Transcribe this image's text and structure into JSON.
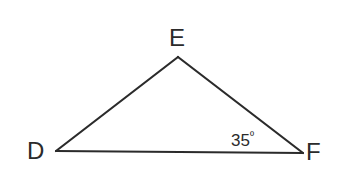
{
  "diagram": {
    "type": "triangle",
    "vertices": [
      {
        "id": "D",
        "label": "D",
        "x": 56,
        "y": 151
      },
      {
        "id": "E",
        "label": "E",
        "x": 178,
        "y": 57
      },
      {
        "id": "F",
        "label": "F",
        "x": 303,
        "y": 153
      }
    ],
    "sides": [
      "DE",
      "EF",
      "DF"
    ],
    "angles": [
      {
        "vertex": "F",
        "value": "35",
        "unit": "º"
      }
    ],
    "colors": {
      "stroke": "#2b2b2b",
      "text": "#2b2b2b",
      "background": "#ffffff"
    }
  }
}
